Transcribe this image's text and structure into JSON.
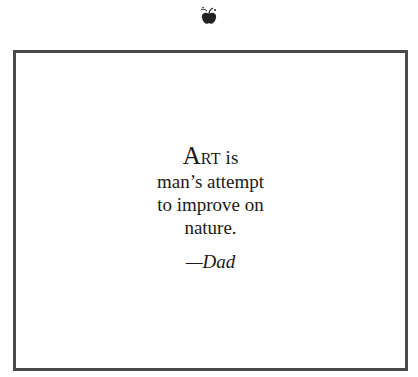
{
  "ornament": {
    "icon": "apple-fleuron-icon"
  },
  "quote": {
    "first_letter": "A",
    "first_word_rest": "RT",
    "line1_rest": " is",
    "lines": [
      "man’s attempt",
      "to improve on",
      "nature."
    ],
    "attribution": "—Dad"
  },
  "colors": {
    "frame": "#4a4a4a",
    "text": "#1a1a1a",
    "background": "#ffffff"
  }
}
